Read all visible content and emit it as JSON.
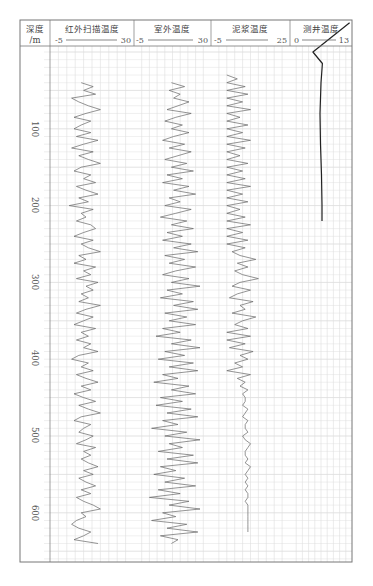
{
  "chart_data": {
    "type": "line",
    "title": "",
    "layout": "well-log multi-track (vertical depth axis)",
    "depth_axis": {
      "label": "深度 /m",
      "ticks": [
        100,
        200,
        300,
        400,
        500,
        600
      ],
      "range": [
        0,
        660
      ],
      "inverted": true
    },
    "grid": true,
    "tracks": [
      {
        "name": "红外扫描温度",
        "scale_min": -5,
        "scale_max": 30,
        "depth": [
          40,
          45,
          50,
          55,
          60,
          65,
          70,
          75,
          80,
          85,
          90,
          95,
          100,
          105,
          110,
          115,
          120,
          125,
          130,
          135,
          140,
          145,
          150,
          155,
          160,
          165,
          170,
          175,
          180,
          185,
          190,
          195,
          200,
          205,
          210,
          215,
          220,
          225,
          230,
          235,
          240,
          245,
          250,
          255,
          260,
          265,
          270,
          275,
          280,
          285,
          290,
          295,
          300,
          305,
          310,
          315,
          320,
          325,
          330,
          335,
          340,
          345,
          350,
          355,
          360,
          365,
          370,
          375,
          380,
          385,
          390,
          395,
          400,
          405,
          410,
          415,
          420,
          425,
          430,
          435,
          440,
          445,
          450,
          455,
          460,
          465,
          470,
          475,
          480,
          485,
          490,
          495,
          500,
          505,
          510,
          515,
          520,
          525,
          530,
          535,
          540,
          545,
          550,
          555,
          560,
          565,
          570,
          575,
          580,
          585,
          590,
          595,
          600,
          605,
          610,
          615,
          620,
          625,
          630,
          635,
          640
        ],
        "values": [
          8,
          13,
          9,
          14,
          4,
          7,
          11,
          16,
          10,
          5,
          12,
          8,
          5,
          12,
          6,
          15,
          9,
          4,
          13,
          7,
          11,
          16,
          8,
          5,
          12,
          9,
          14,
          6,
          10,
          15,
          7,
          11,
          3,
          13,
          8,
          10,
          6,
          12,
          14,
          9,
          5,
          13,
          8,
          11,
          16,
          7,
          10,
          5,
          14,
          9,
          12,
          6,
          15,
          10,
          13,
          8,
          11,
          7,
          16,
          10,
          6,
          13,
          9,
          5,
          14,
          8,
          11,
          6,
          12,
          9,
          15,
          7,
          4,
          11,
          8,
          13,
          6,
          10,
          15,
          8,
          12,
          5,
          9,
          14,
          7,
          11,
          16,
          8,
          5,
          12,
          9,
          7,
          13,
          10,
          6,
          14,
          9,
          12,
          8,
          11,
          15,
          9,
          13,
          7,
          10,
          14,
          8,
          12,
          6,
          9,
          13,
          16,
          8,
          10,
          6,
          4,
          7,
          12,
          9,
          5,
          15
        ]
      },
      {
        "name": "室外温度",
        "scale_min": -5,
        "scale_max": 30,
        "depth": [
          40,
          45,
          50,
          55,
          60,
          65,
          70,
          75,
          80,
          85,
          90,
          95,
          100,
          105,
          110,
          115,
          120,
          125,
          130,
          135,
          140,
          145,
          150,
          155,
          160,
          165,
          170,
          175,
          180,
          185,
          190,
          195,
          200,
          205,
          210,
          215,
          220,
          225,
          230,
          235,
          240,
          245,
          250,
          255,
          260,
          265,
          270,
          275,
          280,
          285,
          290,
          295,
          300,
          305,
          310,
          315,
          320,
          325,
          330,
          335,
          340,
          345,
          350,
          355,
          360,
          365,
          370,
          375,
          380,
          385,
          390,
          395,
          400,
          405,
          410,
          415,
          420,
          425,
          430,
          435,
          440,
          445,
          450,
          455,
          460,
          465,
          470,
          475,
          480,
          485,
          490,
          495,
          500,
          505,
          510,
          515,
          520,
          525,
          530,
          535,
          540,
          545,
          550,
          555,
          560,
          565,
          570,
          575,
          580,
          585,
          590,
          595,
          600,
          605,
          610,
          615,
          620,
          625,
          630,
          635,
          640
        ],
        "values": [
          12,
          18,
          11,
          16,
          13,
          20,
          15,
          10,
          21,
          14,
          9,
          17,
          12,
          20,
          13,
          8,
          18,
          11,
          21,
          15,
          9,
          19,
          12,
          22,
          10,
          17,
          8,
          20,
          13,
          23,
          11,
          16,
          9,
          21,
          14,
          7,
          19,
          12,
          22,
          10,
          17,
          8,
          21,
          13,
          24,
          9,
          18,
          11,
          23,
          14,
          8,
          20,
          12,
          25,
          10,
          17,
          7,
          22,
          13,
          24,
          9,
          19,
          11,
          23,
          8,
          16,
          5,
          21,
          12,
          25,
          9,
          18,
          6,
          22,
          11,
          24,
          8,
          15,
          4,
          20,
          12,
          23,
          7,
          17,
          5,
          21,
          10,
          24,
          8,
          15,
          3,
          19,
          9,
          25,
          11,
          17,
          6,
          22,
          10,
          24,
          7,
          14,
          4,
          18,
          9,
          23,
          6,
          16,
          2,
          20,
          11,
          25,
          8,
          14,
          3,
          19,
          10,
          24,
          7,
          15,
          12
        ]
      },
      {
        "name": "泥浆温度",
        "scale_min": -5,
        "scale_max": 25,
        "depth": [
          30,
          35,
          40,
          45,
          50,
          55,
          60,
          65,
          70,
          75,
          80,
          85,
          90,
          95,
          100,
          105,
          110,
          115,
          120,
          125,
          130,
          135,
          140,
          145,
          150,
          155,
          160,
          165,
          170,
          175,
          180,
          185,
          190,
          195,
          200,
          205,
          210,
          215,
          220,
          225,
          230,
          235,
          240,
          245,
          250,
          255,
          260,
          265,
          270,
          275,
          280,
          285,
          290,
          295,
          300,
          305,
          310,
          315,
          320,
          325,
          330,
          335,
          340,
          345,
          350,
          355,
          360,
          365,
          370,
          375,
          380,
          385,
          390,
          395,
          400,
          405,
          410,
          415,
          420,
          425,
          430,
          435,
          440,
          445,
          450,
          455,
          460,
          465,
          470,
          475,
          480,
          485,
          490,
          495,
          500,
          505,
          510,
          515,
          520,
          525,
          530,
          535,
          540,
          545,
          550,
          555,
          560,
          565,
          570,
          575,
          580,
          585,
          590,
          595,
          600,
          605,
          610,
          615,
          620,
          625,
          630,
          635,
          640
        ],
        "values": [
          1,
          5,
          1,
          8,
          1,
          9,
          1,
          7,
          1,
          10,
          1,
          6,
          1,
          9,
          1,
          7,
          1,
          10,
          1,
          8,
          1,
          6,
          1,
          9,
          1,
          7,
          1,
          8,
          1,
          10,
          1,
          7,
          1,
          9,
          1,
          6,
          1,
          8,
          1,
          10,
          1,
          7,
          1,
          9,
          1,
          8,
          3,
          6,
          12,
          5,
          9,
          4,
          7,
          13,
          6,
          3,
          10,
          5,
          2,
          11,
          6,
          8,
          3,
          12,
          7,
          4,
          9,
          1,
          10,
          1,
          8,
          2,
          11,
          6,
          9,
          4,
          7,
          1,
          10,
          5,
          8,
          6,
          9,
          7,
          8,
          8,
          7,
          9,
          8,
          7,
          9,
          8,
          8,
          9,
          7,
          8,
          10,
          9,
          8,
          8,
          9,
          8,
          10,
          9,
          8,
          9,
          8,
          9,
          8,
          9,
          9,
          8,
          9,
          9,
          9,
          9,
          9,
          9,
          9,
          9
        ]
      },
      {
        "name": "测井温度",
        "scale_min": 0,
        "scale_max": 13,
        "depth": [
          -38,
          0,
          15,
          40,
          80,
          120,
          160,
          200,
          220
        ],
        "values": [
          12.5,
          4.8,
          6.8,
          6.5,
          6.3,
          6.4,
          6.6,
          6.7,
          6.7
        ]
      }
    ]
  },
  "header": {
    "depth_col": {
      "line1": "深度",
      "line2": "/m"
    },
    "tracks": [
      {
        "title": "红外扫描温度",
        "min": "-5",
        "max": "30"
      },
      {
        "title": "室外温度",
        "min": "-5",
        "max": "30"
      },
      {
        "title": "泥浆温度",
        "min": "-5",
        "max": "25"
      },
      {
        "title": "测井温度",
        "min": "0",
        "max": "13"
      }
    ]
  },
  "depth_labels": [
    "100",
    "200",
    "300",
    "400",
    "500",
    "600"
  ],
  "colors": {
    "frame": "#777777",
    "grid": "#d8d8d8",
    "curve": "#666666",
    "well_curve": "#222222"
  }
}
